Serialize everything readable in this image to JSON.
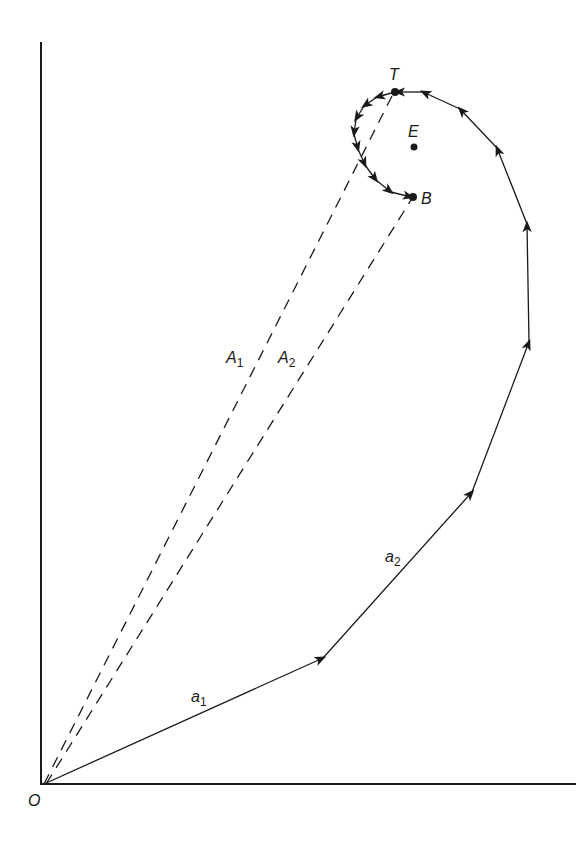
{
  "diagram": {
    "type": "vector-polygon-spiral",
    "axes": {
      "origin_label": "O",
      "origin": [
        44,
        784
      ],
      "y_axis_top": [
        41,
        42
      ],
      "x_axis_end": [
        576,
        784
      ],
      "color": "#1a1a1a"
    },
    "labels": {
      "O": "O",
      "T": "T",
      "E": "E",
      "B": "B",
      "A1": "A",
      "A1_sub": "1",
      "A2": "A",
      "A2_sub": "2",
      "a1": "a",
      "a1_sub": "1",
      "a2": "a",
      "a2_sub": "2"
    },
    "points": {
      "T": [
        395,
        92
      ],
      "E": [
        414,
        147
      ],
      "B": [
        413,
        197
      ]
    },
    "outer_path_vertices": [
      [
        44,
        784
      ],
      [
        323,
        658
      ],
      [
        472,
        492
      ],
      [
        529,
        342
      ],
      [
        527,
        224
      ],
      [
        497,
        148
      ],
      [
        460,
        109
      ],
      [
        423,
        92
      ],
      [
        395,
        92
      ]
    ],
    "inner_spiral": "T to B counter-clockwise around E",
    "dashed_lines": [
      {
        "name": "A1",
        "from": [
          44,
          784
        ],
        "to": [
          395,
          92
        ]
      },
      {
        "name": "A2",
        "from": [
          44,
          784
        ],
        "to": [
          413,
          197
        ]
      }
    ],
    "colors": {
      "stroke": "#1a1a1a",
      "background": "#ffffff"
    }
  }
}
